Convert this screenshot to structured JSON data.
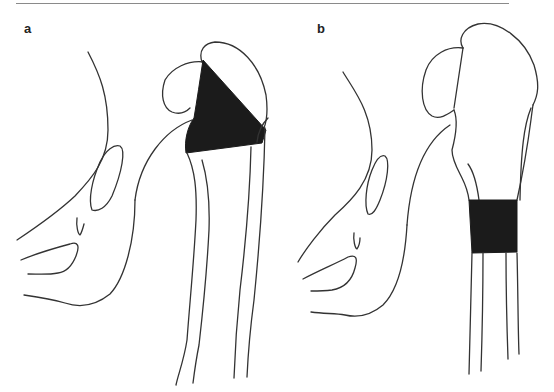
{
  "figure": {
    "panels": [
      {
        "label": "a",
        "description": "Proximal femur with triangular (wedge-shaped) dark lesion at the head-neck/trochanteric region"
      },
      {
        "label": "b",
        "description": "Proximal femur with rectangular dark segment across the femoral shaft"
      }
    ],
    "colors": {
      "line": "#333333",
      "fill": "#1b1b1b",
      "rule": "#8a8a8a",
      "background": "#ffffff"
    }
  }
}
